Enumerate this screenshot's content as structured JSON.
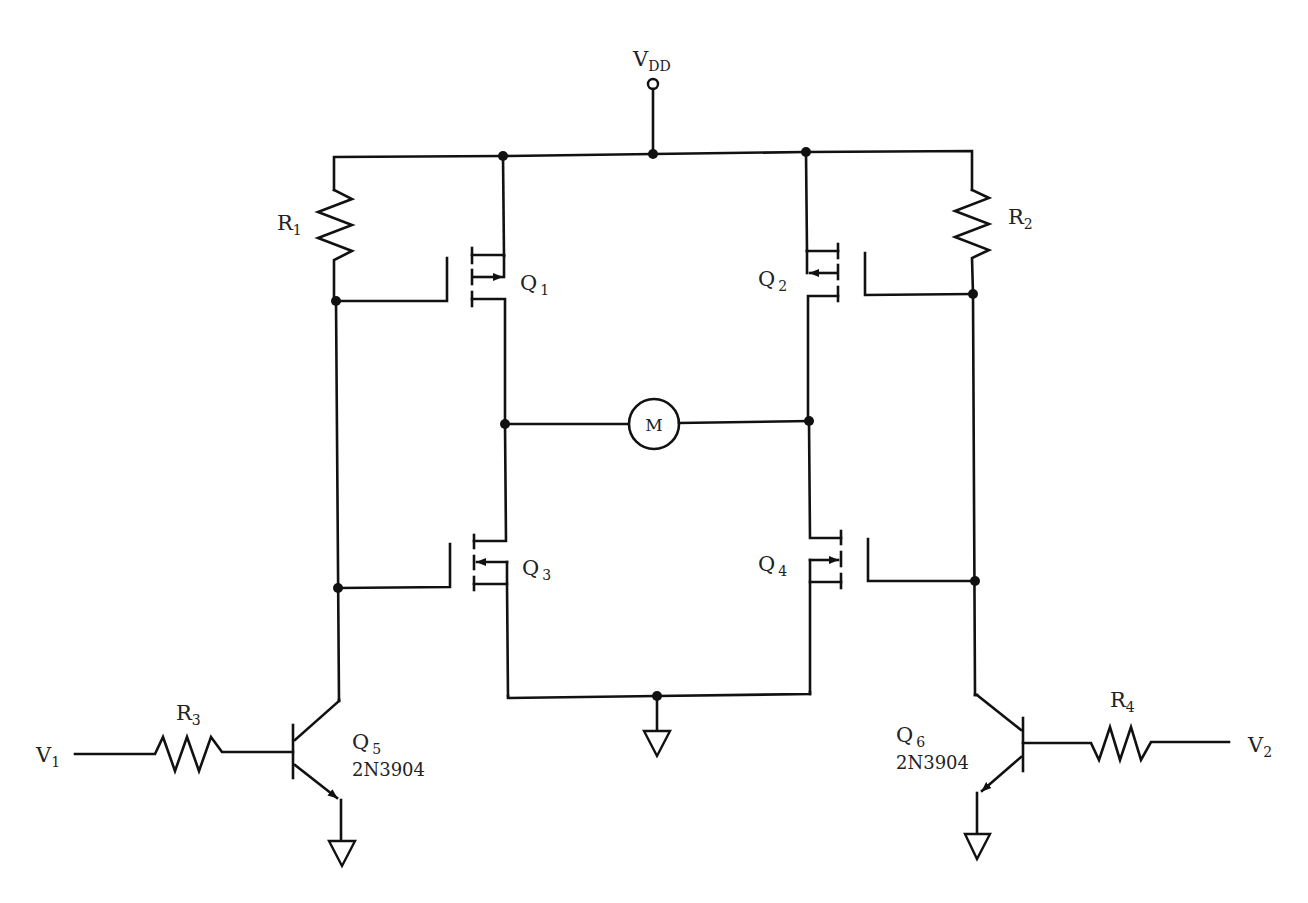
{
  "diagram": {
    "type": "circuit-schematic",
    "supply": {
      "label": "V",
      "sub": "DD"
    },
    "motor": {
      "label": "M"
    },
    "resistors": [
      {
        "id": "R1",
        "label": "R",
        "sub": "1"
      },
      {
        "id": "R2",
        "label": "R",
        "sub": "2"
      },
      {
        "id": "R3",
        "label": "R",
        "sub": "3"
      },
      {
        "id": "R4",
        "label": "R",
        "sub": "4"
      }
    ],
    "mosfets": [
      {
        "id": "Q1",
        "label": "Q",
        "sub": "1",
        "type": "p-channel"
      },
      {
        "id": "Q2",
        "label": "Q",
        "sub": "2",
        "type": "p-channel"
      },
      {
        "id": "Q3",
        "label": "Q",
        "sub": "3",
        "type": "n-channel"
      },
      {
        "id": "Q4",
        "label": "Q",
        "sub": "4",
        "type": "n-channel"
      }
    ],
    "bjts": [
      {
        "id": "Q5",
        "label": "Q",
        "sub": "5",
        "part": "2N3904",
        "type": "npn"
      },
      {
        "id": "Q6",
        "label": "Q",
        "sub": "6",
        "part": "2N3904",
        "type": "npn"
      }
    ],
    "inputs": [
      {
        "id": "V1",
        "label": "V",
        "sub": "1"
      },
      {
        "id": "V2",
        "label": "V",
        "sub": "2"
      }
    ],
    "grounds": 3
  }
}
